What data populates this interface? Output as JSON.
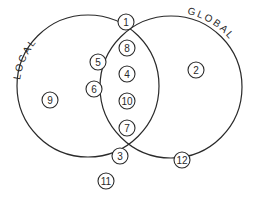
{
  "diagram": {
    "type": "venn",
    "sets": [
      {
        "id": "local",
        "label": "LOCAL",
        "cx": 88,
        "cy": 86,
        "r": 71
      },
      {
        "id": "global",
        "label": "GLOBAL",
        "cx": 171,
        "cy": 87,
        "r": 71
      }
    ],
    "nodes": [
      {
        "id": "1",
        "label": "1",
        "x": 126,
        "y": 22
      },
      {
        "id": "8",
        "label": "8",
        "x": 127,
        "y": 48
      },
      {
        "id": "5",
        "label": "5",
        "x": 98,
        "y": 62
      },
      {
        "id": "4",
        "label": "4",
        "x": 127,
        "y": 74
      },
      {
        "id": "6",
        "label": "6",
        "x": 94,
        "y": 89
      },
      {
        "id": "10",
        "label": "10",
        "x": 127,
        "y": 101
      },
      {
        "id": "7",
        "label": "7",
        "x": 127,
        "y": 128
      },
      {
        "id": "3",
        "label": "3",
        "x": 120,
        "y": 156
      },
      {
        "id": "11",
        "label": "11",
        "x": 106,
        "y": 181
      },
      {
        "id": "9",
        "label": "9",
        "x": 50,
        "y": 100
      },
      {
        "id": "2",
        "label": "2",
        "x": 196,
        "y": 70
      },
      {
        "id": "12",
        "label": "12",
        "x": 182,
        "y": 160
      }
    ]
  }
}
